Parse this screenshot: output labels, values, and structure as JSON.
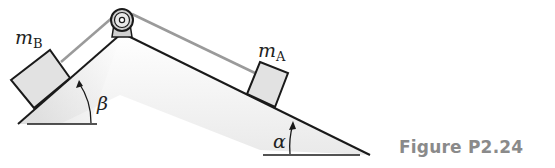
{
  "figure": {
    "caption": "Figure P2.24",
    "labels": {
      "mass_b": "m",
      "mass_b_sub": "B",
      "mass_a": "m",
      "mass_a_sub": "A",
      "angle_left": "β",
      "angle_right": "α"
    },
    "colors": {
      "line": "#1a1a1a",
      "rope": "#9a9a9a",
      "block_fill": "#e2e2e2",
      "caption": "#8a8a8a"
    }
  }
}
